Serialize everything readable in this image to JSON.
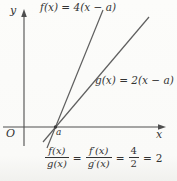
{
  "figure": {
    "y_axis_label": "y",
    "x_axis_label": "x",
    "origin_label": "O",
    "a_label": "a",
    "f_label": "f(x) = 4(x − a)",
    "g_label": "g(x) = 2(x − a)"
  },
  "formula": {
    "lhs": {
      "num": "f(x)",
      "den": "g(x)"
    },
    "eq1": "=",
    "derivative_ratio": {
      "num": "f′(x)",
      "den": "g′(x)"
    },
    "eq2": "=",
    "slope_ratio": {
      "num": "4",
      "den": "2"
    },
    "eq3": "=",
    "result": "2"
  },
  "colors": {
    "background": "#fbfbf9",
    "line": "#585858",
    "text": "#333333"
  }
}
